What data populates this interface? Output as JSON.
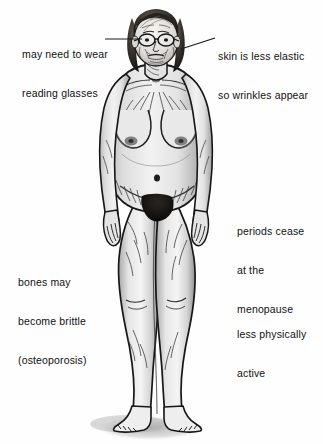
{
  "diagram": {
    "background_color": "#fefefe",
    "text_color": "#111111",
    "leader_line_color": "#1a1a1a"
  },
  "annotations": [
    {
      "id": "glasses",
      "lines": [
        "may need to wear",
        "reading glasses"
      ],
      "side": "left",
      "target": "eyes-glasses",
      "leader": {
        "from_x": 105,
        "from_y": 39,
        "to_x": 142,
        "to_y": 39
      }
    },
    {
      "id": "skin",
      "lines": [
        "skin is less elastic",
        "so wrinkles appear"
      ],
      "side": "right",
      "target": "face-cheek",
      "leader": {
        "from_x": 215,
        "from_y": 38,
        "to_x": 181,
        "to_y": 49
      }
    },
    {
      "id": "periods",
      "lines": [
        "periods cease",
        "at the",
        "menopause"
      ],
      "side": "right",
      "target": "pelvis",
      "leader": null
    },
    {
      "id": "bones",
      "lines": [
        "bones may",
        "become brittle",
        "(osteoporosis)"
      ],
      "side": "left",
      "target": "legs-skeleton",
      "leader": null
    },
    {
      "id": "active",
      "lines": [
        "less physically",
        "active"
      ],
      "side": "right",
      "target": "legs",
      "leader": null
    }
  ],
  "figure_parts": [
    "hair",
    "face",
    "glasses",
    "neck",
    "shoulders",
    "arms",
    "hands",
    "breasts",
    "abdomen",
    "navel",
    "pubic-hair",
    "thighs",
    "knees",
    "calves",
    "feet",
    "ground-shadow"
  ]
}
